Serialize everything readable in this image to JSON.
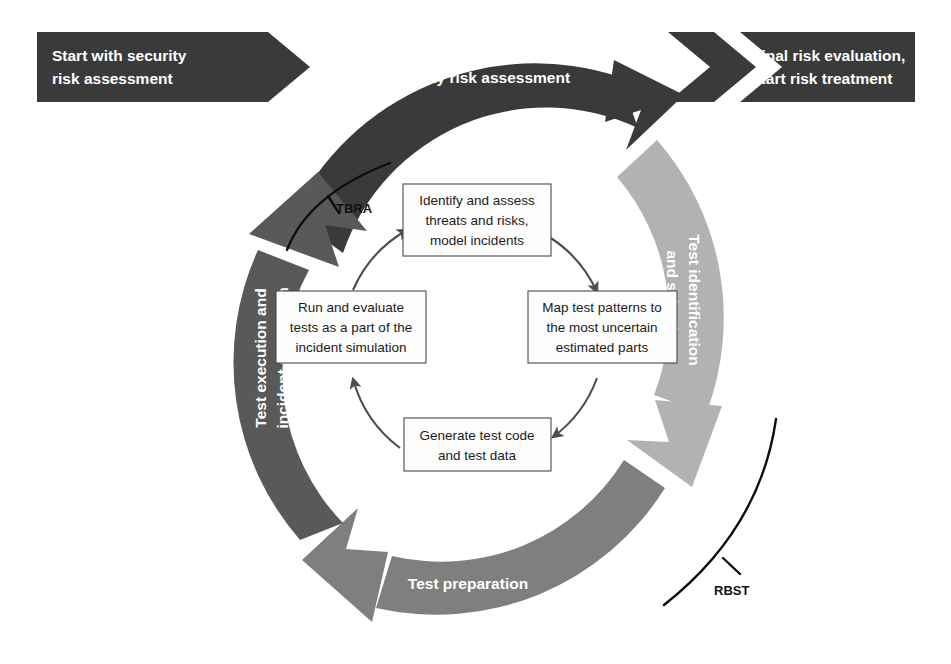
{
  "diagram": {
    "background_color": "#ffffff"
  },
  "colors": {
    "dark": "#3a3a3a",
    "mid_dark": "#595959",
    "mid": "#7f7f7f",
    "light": "#b2b2b2",
    "box_stroke": "#4a4a4a",
    "box_fill": "#fdfdfd",
    "text_light": "#ffffff",
    "text_dark": "#1b1b1b",
    "tag_line": "#0d0d0d"
  },
  "entry_banner": {
    "name": "start-banner",
    "lines": [
      "Start with security",
      "risk assessment"
    ],
    "color": "#3a3a3a"
  },
  "entry_chevron": {
    "name": "entry-chevron",
    "color": "#3a3a3a"
  },
  "exit_chevron": {
    "name": "exit-chevron",
    "color": "#3a3a3a"
  },
  "exit_banner": {
    "name": "final-banner",
    "lines": [
      "Final risk evaluation,",
      "start risk treatment"
    ],
    "color": "#3a3a3a"
  },
  "ring_segments": [
    {
      "name": "security-risk-assessment-arc",
      "label": "Security risk assessment",
      "color": "#3a3a3a",
      "position": "top",
      "text_orientation": "horizontal"
    },
    {
      "name": "test-identification-and-selection-arc",
      "label_lines": [
        "Test identification",
        "and selection"
      ],
      "label": "Test identification and selection",
      "color": "#b2b2b2",
      "position": "right",
      "text_orientation": "rotated-clockwise"
    },
    {
      "name": "test-preparation-arc",
      "label": "Test preparation",
      "color": "#7f7f7f",
      "position": "bottom",
      "text_orientation": "horizontal"
    },
    {
      "name": "test-execution-and-incident-simulation-arc",
      "label_lines": [
        "Test execution and",
        "incident simulation"
      ],
      "label": "Test execution and incident simulation",
      "color": "#595959",
      "position": "left",
      "text_orientation": "rotated-counterclockwise"
    }
  ],
  "inner_cycle": {
    "direction": "clockwise",
    "boxes": [
      {
        "name": "identify-and-assess-box",
        "position": "top",
        "lines": [
          "Identify and assess",
          "threats and risks,",
          "model incidents"
        ]
      },
      {
        "name": "map-test-patterns-box",
        "position": "right",
        "lines": [
          "Map test patterns to",
          "the most uncertain",
          "estimated parts"
        ]
      },
      {
        "name": "generate-test-code-box",
        "position": "bottom",
        "lines": [
          "Generate test code",
          "and test data"
        ]
      },
      {
        "name": "run-and-evaluate-box",
        "position": "left",
        "lines": [
          "Run and evaluate",
          "tests as a part of the",
          "incident simulation"
        ]
      }
    ]
  },
  "annotations": [
    {
      "name": "tbra-tag",
      "label": "TBRA",
      "position": "upper-left-inner"
    },
    {
      "name": "rbst-tag",
      "label": "RBST",
      "position": "lower-right-outer"
    }
  ]
}
